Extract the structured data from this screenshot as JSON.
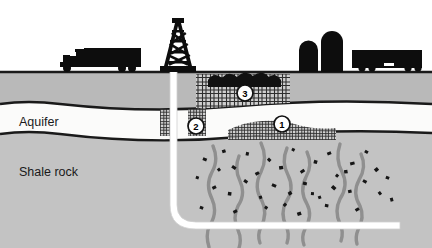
{
  "figure": {
    "type": "cross-section-diagram",
    "background_color": "#ffffff"
  },
  "labels": {
    "aquifer": "Aquifer",
    "shale_rock": "Shale rock"
  },
  "callouts": [
    {
      "id": "callout-1",
      "number": "1",
      "cx": 282,
      "cy": 124
    },
    {
      "id": "callout-2",
      "number": "2",
      "cx": 196,
      "cy": 126
    },
    {
      "id": "callout-3",
      "number": "3",
      "cx": 245,
      "cy": 93
    }
  ],
  "layers": [
    {
      "name": "sky",
      "color": "#ffffff"
    },
    {
      "name": "topsoil",
      "color": "#b9b9b9",
      "top": 72,
      "bottom": 103
    },
    {
      "name": "aquifer",
      "color": "#fbfbfa",
      "top": 103,
      "bottom": 135
    },
    {
      "name": "shale-rock",
      "color": "#c3c3c3",
      "top": 135,
      "bottom": 248
    }
  ],
  "colors": {
    "outline": "#1a1a1a",
    "topsoil": "#b9b9b9",
    "aquifer": "#fbfbfa",
    "shale": "#c3c3c3",
    "fracture": "#8f8f8f",
    "debris": "#161616",
    "wellbore": "#ffffff",
    "equipment": "#0d0d0d",
    "hatch": "#3a3a3a",
    "plume": "#111111"
  },
  "surface_equipment": [
    {
      "name": "tanker-truck-left",
      "x": 50,
      "y": 72
    },
    {
      "name": "drilling-derrick",
      "x": 178,
      "y": 72
    },
    {
      "name": "storage-tank-a",
      "x": 302,
      "y": 72
    },
    {
      "name": "storage-tank-b",
      "x": 325,
      "y": 72
    },
    {
      "name": "tanker-truck-right",
      "x": 370,
      "y": 72
    }
  ],
  "wellbore": {
    "name": "well-casing",
    "vertical_x": 183,
    "surface_y": 72,
    "kickoff_y": 212,
    "horizontal_y": 222,
    "toe_x": 400
  },
  "fractures": {
    "count": 7,
    "x_positions": [
      213,
      239,
      260,
      287,
      306,
      340,
      360
    ]
  }
}
